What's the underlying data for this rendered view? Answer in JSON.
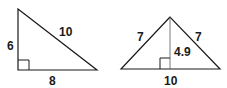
{
  "figures": [
    {
      "name": "right-triangle",
      "labels": {
        "left_leg": "6",
        "hypotenuse": "10",
        "base": "8"
      }
    },
    {
      "name": "isosceles-triangle",
      "labels": {
        "left_side": "7",
        "right_side": "7",
        "height": "4.9",
        "base": "10"
      }
    }
  ],
  "colors": {
    "stroke": "#1a1a1a",
    "background": "#ffffff"
  }
}
